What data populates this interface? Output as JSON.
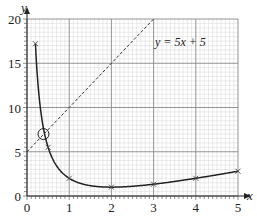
{
  "chart_data": {
    "type": "line",
    "title": "",
    "xlabel": "x",
    "ylabel": "y",
    "xlim": [
      0,
      5
    ],
    "ylim": [
      0,
      20
    ],
    "x_ticks": [
      "0",
      "1",
      "2",
      "3",
      "4",
      "5"
    ],
    "y_ticks": [
      "0",
      "5",
      "10",
      "15",
      "20"
    ],
    "grid": true,
    "series": [
      {
        "name": "curve",
        "style": "solid",
        "equation": "y = x + 4/x - 3",
        "markers": "x",
        "points": [
          [
            0.2,
            17.2
          ],
          [
            0.5,
            5.5
          ],
          [
            1,
            2
          ],
          [
            2,
            1
          ],
          [
            3,
            1.33
          ],
          [
            4,
            2
          ],
          [
            5,
            2.8
          ]
        ]
      },
      {
        "name": "y = 5x + 5",
        "style": "dashed",
        "points": [
          [
            0,
            5
          ],
          [
            3,
            20
          ]
        ]
      }
    ],
    "annotations": [
      {
        "text": "y = 5x + 5",
        "x": 3.05,
        "y": 15.6
      },
      {
        "type": "circle",
        "x": 0.39,
        "y": 7.0,
        "label": "intersection"
      }
    ]
  },
  "axes": {
    "x_label": "x",
    "y_label": "y"
  },
  "line_label": "y = 5x + 5"
}
